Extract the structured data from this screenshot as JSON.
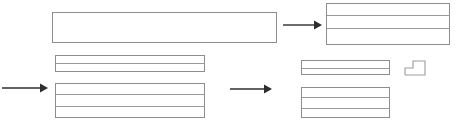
{
  "diagram": {
    "type": "block-flow",
    "canvas": {
      "width": 459,
      "height": 129,
      "background": "#ffffff"
    },
    "style": {
      "block_stroke": "#8d8d8d",
      "divider_stroke": "#9a9a9a",
      "arrow_color": "#2e2e2e",
      "step_stroke": "#9b9b9b",
      "fill": "none"
    },
    "blocks": [
      {
        "id": "block-top-left",
        "label": "top-left-wide-block",
        "x": 52,
        "y": 12,
        "width": 225,
        "height": 31,
        "rows": 1,
        "dividers": []
      },
      {
        "id": "block-top-right",
        "label": "top-right-striped-block",
        "x": 326,
        "y": 3,
        "width": 124,
        "height": 42,
        "rows": 3,
        "dividers": [
          15,
          28
        ]
      },
      {
        "id": "block-mid-left-strip",
        "label": "middle-left-thin-strip",
        "x": 55,
        "y": 55,
        "width": 150,
        "height": 17,
        "rows": 2,
        "dividers": [
          63
        ]
      },
      {
        "id": "block-bottom-left",
        "label": "bottom-left-striped-block",
        "x": 55,
        "y": 83,
        "width": 150,
        "height": 35,
        "rows": 3,
        "dividers": [
          94,
          106
        ]
      },
      {
        "id": "block-mid-right-strip",
        "label": "middle-right-thin-strip",
        "x": 301,
        "y": 60,
        "width": 89,
        "height": 15,
        "rows": 2,
        "dividers": [
          68
        ]
      },
      {
        "id": "block-bottom-right",
        "label": "bottom-right-striped-block",
        "x": 301,
        "y": 87,
        "width": 89,
        "height": 31,
        "rows": 3,
        "dividers": [
          97,
          108
        ]
      }
    ],
    "arrows": [
      {
        "id": "arrow-top",
        "label": "top-arrow-right",
        "x1": 283,
        "y1": 25,
        "x2": 322,
        "y2": 25,
        "direction": "right"
      },
      {
        "id": "arrow-left-in",
        "label": "left-input-arrow",
        "x1": 2,
        "y1": 88,
        "x2": 48,
        "y2": 88,
        "direction": "right"
      },
      {
        "id": "arrow-middle",
        "label": "middle-arrow-right",
        "x1": 230,
        "y1": 89,
        "x2": 272,
        "y2": 89,
        "direction": "right"
      }
    ],
    "shapes": [
      {
        "id": "step-shape",
        "label": "staircase-step-shape",
        "points": "405,75 405,68 413,68 413,61 425,61 425,75 405,75",
        "description": "two-step staircase outline"
      }
    ]
  }
}
